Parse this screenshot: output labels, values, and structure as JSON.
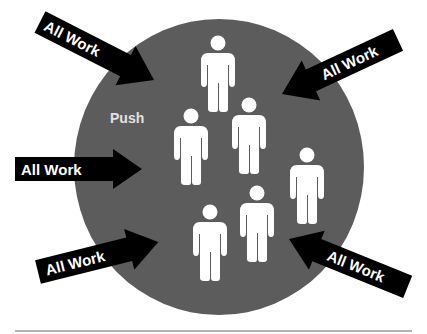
{
  "diagram": {
    "type": "push-work-diagram",
    "circle": {
      "label": "Push",
      "color": "#5c5c5c",
      "label_color": "#e2e2e2"
    },
    "people_count": 6,
    "person_color": "#ffffff",
    "arrow_color": "#000000",
    "arrows": [
      {
        "id": "top-left",
        "label": "All Work",
        "direction": "inward"
      },
      {
        "id": "top-right",
        "label": "All Work",
        "direction": "inward"
      },
      {
        "id": "middle-left",
        "label": "All Work",
        "direction": "inward"
      },
      {
        "id": "bottom-left",
        "label": "All Work",
        "direction": "inward"
      },
      {
        "id": "bottom-right",
        "label": "All Work",
        "direction": "inward"
      }
    ],
    "footer_rule_color": "#9a9a9a"
  }
}
